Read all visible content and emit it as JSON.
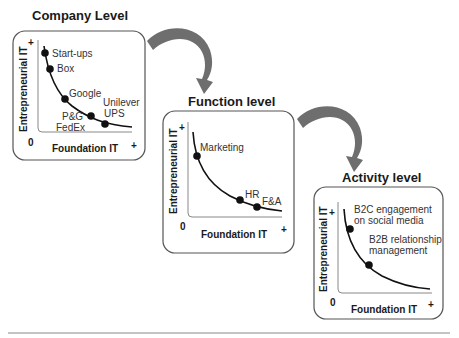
{
  "panels": [
    {
      "title": "Company Level",
      "y_axis": "Entrepreneurial IT",
      "x_axis": "Foundation IT",
      "origin": "0",
      "plus": "+",
      "points": [
        "Start-ups",
        "Box",
        "Google",
        "P&G",
        "FedEx",
        "Unilever",
        "UPS"
      ]
    },
    {
      "title": "Function level",
      "y_axis": "Entrepreneurial IT",
      "x_axis": "Foundation IT",
      "origin": "0",
      "plus": "+",
      "points": [
        "Marketing",
        "HR",
        "F&A"
      ]
    },
    {
      "title": "Activity level",
      "y_axis": "Entrepreneurial IT",
      "x_axis": "Foundation IT",
      "origin": "0",
      "plus": "+",
      "points": [
        "B2C engagement",
        "on social media",
        "B2B relationship",
        "management"
      ]
    }
  ],
  "colors": {
    "arrow": "#6e6e6e",
    "box_border": "#555555",
    "curve": "#111111",
    "rule": "#888888"
  }
}
